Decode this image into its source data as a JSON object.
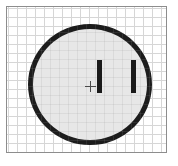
{
  "figure": {
    "background_color": "#ffffff",
    "caption": ""
  },
  "sheet": {
    "name": "graph-paper-sheet",
    "border_color": "#8d8d8d",
    "paper_color": "#ffffff",
    "grid": {
      "line_color": "#d6d6d6",
      "cell_size_px": 9,
      "visible": "true"
    }
  },
  "outlet": {
    "face": {
      "shape": "circle",
      "fill_color": "#e7e7e7",
      "outline_color": "#1c1c1c",
      "outline_width_px": 5
    },
    "slots": [
      {
        "id": "slot-left",
        "label": "",
        "color": "#1a1a1a",
        "orientation": "vertical"
      },
      {
        "id": "slot-right",
        "label": "",
        "color": "#1a1a1a",
        "orientation": "vertical"
      }
    ],
    "center_mark": {
      "id": "center-cross",
      "label": "",
      "color": "#4a4a4a",
      "shape": "plus"
    }
  }
}
